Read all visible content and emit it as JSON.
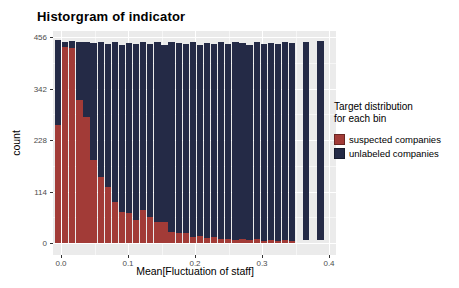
{
  "chart_data": {
    "type": "bar",
    "stacked": true,
    "title": "Historgram of indicator",
    "xlabel": "Mean[Fluctuation of staff]",
    "ylabel": "count",
    "yticks": [
      0,
      114,
      228,
      342,
      456
    ],
    "yticks_minor": [
      57,
      171,
      285,
      399
    ],
    "xticks": [
      0.0,
      0.1,
      0.2,
      0.3,
      0.4
    ],
    "xticks_minor": [
      0.05,
      0.15,
      0.25,
      0.35
    ],
    "xlim": [
      -0.012,
      0.41
    ],
    "ylim": [
      -27,
      469
    ],
    "grid": true,
    "legend_position": "right",
    "panel_bg": "#EBEBEB",
    "gridline_color": "#FFFFFF",
    "bin_width": 0.0106,
    "bin_start": -0.009,
    "series": [
      {
        "name": "suspected companies",
        "color": "#A23B37"
      },
      {
        "name": "unlabeled companies",
        "color": "#242A46"
      }
    ],
    "bins": [
      {
        "suspected": 261,
        "unlabeled": 188
      },
      {
        "suspected": 434,
        "unlabeled": 11
      },
      {
        "suspected": 431,
        "unlabeled": 16
      },
      {
        "suspected": 317,
        "unlabeled": 127
      },
      {
        "suspected": 279,
        "unlabeled": 167
      },
      {
        "suspected": 184,
        "unlabeled": 258
      },
      {
        "suspected": 146,
        "unlabeled": 299
      },
      {
        "suspected": 124,
        "unlabeled": 316
      },
      {
        "suspected": 90,
        "unlabeled": 354
      },
      {
        "suspected": 69,
        "unlabeled": 369
      },
      {
        "suspected": 66,
        "unlabeled": 377
      },
      {
        "suspected": 52,
        "unlabeled": 388
      },
      {
        "suspected": 73,
        "unlabeled": 372
      },
      {
        "suspected": 58,
        "unlabeled": 383
      },
      {
        "suspected": 47,
        "unlabeled": 399
      },
      {
        "suspected": 47,
        "unlabeled": 392
      },
      {
        "suspected": 25,
        "unlabeled": 419
      },
      {
        "suspected": 23,
        "unlabeled": 419
      },
      {
        "suspected": 23,
        "unlabeled": 417
      },
      {
        "suspected": 14,
        "unlabeled": 431
      },
      {
        "suspected": 16,
        "unlabeled": 422
      },
      {
        "suspected": 12,
        "unlabeled": 431
      },
      {
        "suspected": 14,
        "unlabeled": 427
      },
      {
        "suspected": 9,
        "unlabeled": 437
      },
      {
        "suspected": 9,
        "unlabeled": 431
      },
      {
        "suspected": 7,
        "unlabeled": 437
      },
      {
        "suspected": 8,
        "unlabeled": 434
      },
      {
        "suspected": 6,
        "unlabeled": 433
      },
      {
        "suspected": 8,
        "unlabeled": 437
      },
      {
        "suspected": 5,
        "unlabeled": 436
      },
      {
        "suspected": 6,
        "unlabeled": 437
      },
      {
        "suspected": 5,
        "unlabeled": 435
      },
      {
        "suspected": 6,
        "unlabeled": 440
      },
      {
        "suspected": 5,
        "unlabeled": 437
      },
      null,
      {
        "suspected": 0,
        "unlabeled": 438,
        "base": 7
      },
      null,
      {
        "suspected": 0,
        "unlabeled": 441,
        "base": 7
      }
    ]
  },
  "legend": {
    "title_line1": "Target distribution",
    "title_line2": "for each bin",
    "items": [
      {
        "label": "suspected companies",
        "color": "#A23B37"
      },
      {
        "label": "unlabeled companies",
        "color": "#242A46"
      }
    ]
  }
}
